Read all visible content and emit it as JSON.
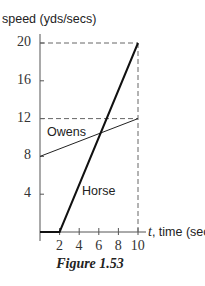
{
  "chart_data": {
    "type": "line",
    "title": "",
    "caption": "Figure 1.53",
    "xlabel_var": "t",
    "xlabel_rest": ", time (sec)",
    "ylabel": "speed (yds/secs)",
    "xlim": [
      0,
      10
    ],
    "ylim": [
      0,
      20
    ],
    "xticks": [
      2,
      4,
      6,
      8,
      10
    ],
    "yticks": [
      4,
      8,
      12,
      16,
      20
    ],
    "grid": false,
    "series": [
      {
        "name": "Owens",
        "x": [
          0,
          10
        ],
        "y": [
          8,
          12
        ],
        "color": "#222222",
        "width": 1
      },
      {
        "name": "Horse",
        "x": [
          0,
          2,
          10
        ],
        "y": [
          0,
          0,
          20
        ],
        "color": "#111111",
        "width": 2
      }
    ],
    "reference_lines": [
      {
        "type": "horizontal-dashed",
        "y": 20,
        "x_from": 0,
        "x_to": 10
      },
      {
        "type": "horizontal-dashed",
        "y": 12,
        "x_from": 0,
        "x_to": 10
      },
      {
        "type": "vertical-dashed",
        "x": 10,
        "y_from": 0,
        "y_to": 20
      }
    ],
    "legend": "inline labels"
  },
  "labels": {
    "ylabel": "speed (yds/secs)",
    "xlabel_var": "t",
    "xlabel_rest": ", time (sec)",
    "caption": "Figure 1.53",
    "owens": "Owens",
    "horse": "Horse"
  },
  "ticks": {
    "x": [
      "2",
      "4",
      "6",
      "8",
      "10"
    ],
    "y": [
      "20",
      "16",
      "12",
      "8",
      "4"
    ]
  }
}
